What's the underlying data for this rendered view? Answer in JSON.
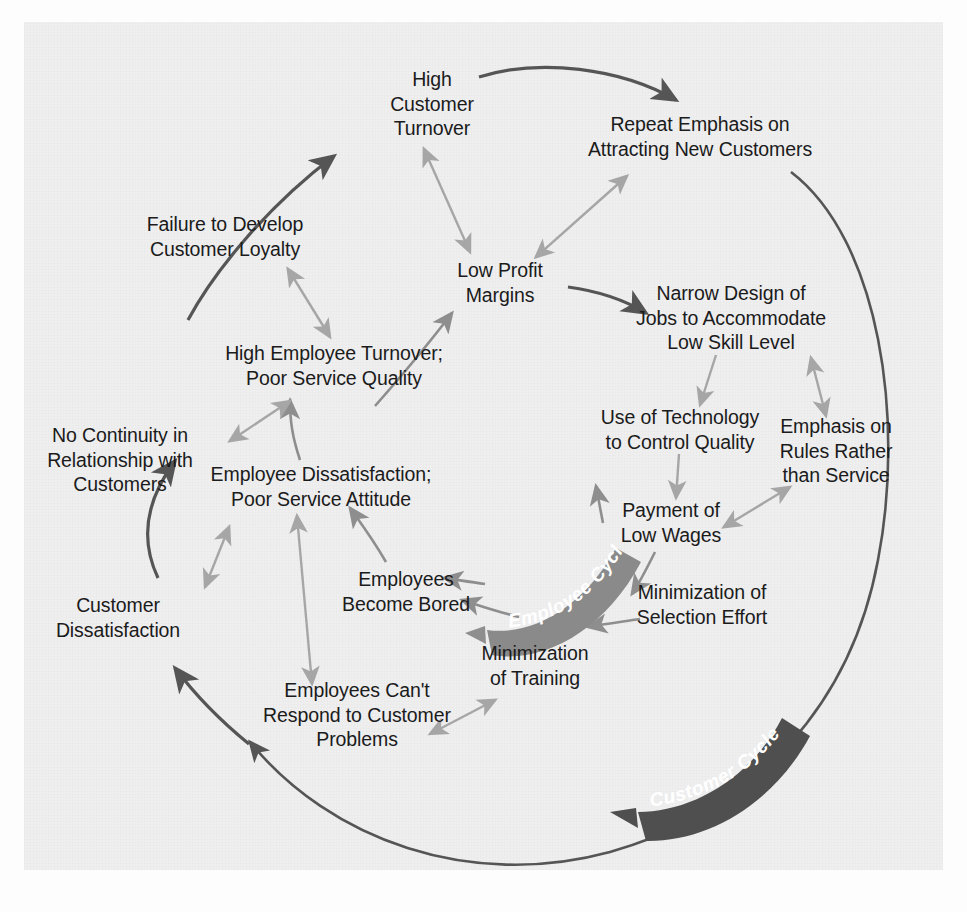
{
  "diagram": {
    "type": "cycle-diagram",
    "background_color": "#efeff0",
    "colors": {
      "dark_arrow": "#555555",
      "light_arrow": "#a6a6a6",
      "mid_arrow": "#8e8e8e",
      "employee_banner": "#8a8a8a",
      "customer_banner": "#4f4f4f",
      "text": "#1b1b1b",
      "banner_text": "#ffffff"
    },
    "nodes": [
      {
        "id": "high-customer-turnover",
        "label": "High\nCustomer\nTurnover",
        "x": 432,
        "y": 104
      },
      {
        "id": "repeat-emphasis",
        "label": "Repeat Emphasis on\nAttracting New Customers",
        "x": 700,
        "y": 137
      },
      {
        "id": "failure-develop-loyalty",
        "label": "Failure to Develop\nCustomer Loyalty",
        "x": 225,
        "y": 237
      },
      {
        "id": "low-profit-margins",
        "label": "Low Profit\nMargins",
        "x": 500,
        "y": 283
      },
      {
        "id": "narrow-design-jobs",
        "label": "Narrow Design of\nJobs to Accommodate\nLow Skill Level",
        "x": 731,
        "y": 318
      },
      {
        "id": "high-employee-turnover",
        "label": "High Employee Turnover;\nPoor Service Quality",
        "x": 334,
        "y": 366
      },
      {
        "id": "use-of-technology",
        "label": "Use of Technology\nto Control Quality",
        "x": 680,
        "y": 430
      },
      {
        "id": "emphasis-on-rules",
        "label": "Emphasis on\nRules Rather\nthan Service",
        "x": 836,
        "y": 451
      },
      {
        "id": "no-continuity",
        "label": "No Continuity in\nRelationship with\nCustomers",
        "x": 120,
        "y": 460
      },
      {
        "id": "employee-dissatisfaction",
        "label": "Employee Dissatisfaction;\nPoor Service Attitude",
        "x": 321,
        "y": 487
      },
      {
        "id": "payment-low-wages",
        "label": "Payment of\nLow Wages",
        "x": 671,
        "y": 523
      },
      {
        "id": "minimization-selection",
        "label": "Minimization of\nSelection Effort",
        "x": 702,
        "y": 605
      },
      {
        "id": "employees-become-bored",
        "label": "Employees\nBecome Bored",
        "x": 406,
        "y": 592
      },
      {
        "id": "customer-dissatisfaction",
        "label": "Customer\nDissatisfaction",
        "x": 118,
        "y": 618
      },
      {
        "id": "minimization-training",
        "label": "Minimization\nof Training",
        "x": 535,
        "y": 666
      },
      {
        "id": "employees-cant-respond",
        "label": "Employees Can't\nRespond to Customer\nProblems",
        "x": 357,
        "y": 715
      }
    ],
    "banners": [
      {
        "id": "employee-cycle",
        "label": "Employee Cycle",
        "color": "#8a8a8a"
      },
      {
        "id": "customer-cycle",
        "label": "Customer Cycle",
        "color": "#4f4f4f"
      }
    ],
    "edges": [
      {
        "from": "high-customer-turnover",
        "to": "repeat-emphasis",
        "style": "dark-curve",
        "heads": 1
      },
      {
        "from": "failure-develop-loyalty",
        "to": "high-customer-turnover",
        "style": "dark-curve",
        "heads": 1
      },
      {
        "from": "high-customer-turnover",
        "to": "low-profit-margins",
        "style": "light",
        "heads": 2
      },
      {
        "from": "low-profit-margins",
        "to": "repeat-emphasis",
        "style": "light",
        "heads": 2
      },
      {
        "from": "low-profit-margins",
        "to": "narrow-design-jobs",
        "style": "dark-curve",
        "heads": 1
      },
      {
        "from": "high-employee-turnover",
        "to": "failure-develop-loyalty",
        "style": "light",
        "heads": 2
      },
      {
        "from": "high-employee-turnover",
        "to": "low-profit-margins",
        "style": "mid-curve",
        "heads": 1
      },
      {
        "from": "narrow-design-jobs",
        "to": "use-of-technology",
        "style": "light",
        "heads": 1
      },
      {
        "from": "narrow-design-jobs",
        "to": "emphasis-on-rules",
        "style": "light",
        "heads": 2
      },
      {
        "from": "use-of-technology",
        "to": "payment-low-wages",
        "style": "light",
        "heads": 1
      },
      {
        "from": "payment-low-wages",
        "to": "emphasis-on-rules",
        "style": "light",
        "heads": 2
      },
      {
        "from": "payment-low-wages",
        "to": "minimization-selection",
        "style": "mid",
        "heads": 1
      },
      {
        "from": "no-continuity",
        "to": "high-employee-turnover",
        "style": "light",
        "heads": 2
      },
      {
        "from": "customer-dissatisfaction",
        "to": "no-continuity",
        "style": "dark-curve",
        "heads": 1
      },
      {
        "from": "employee-dissatisfaction",
        "to": "high-employee-turnover",
        "style": "mid",
        "heads": 1
      },
      {
        "from": "employee-dissatisfaction",
        "to": "customer-dissatisfaction",
        "style": "light",
        "heads": 2
      },
      {
        "from": "employees-become-bored",
        "to": "employee-dissatisfaction",
        "style": "mid",
        "heads": 1
      },
      {
        "from": "employees-cant-respond",
        "to": "employee-dissatisfaction",
        "style": "light",
        "heads": 2
      },
      {
        "from": "minimization-training",
        "to": "employees-become-bored",
        "style": "mid",
        "heads": 1
      },
      {
        "from": "minimization-selection",
        "to": "employees-become-bored",
        "style": "mid",
        "heads": 1
      },
      {
        "from": "minimization-training",
        "to": "employees-cant-respond",
        "style": "light",
        "heads": 2
      },
      {
        "from": "employees-cant-respond",
        "to": "customer-dissatisfaction",
        "style": "dark-curve",
        "heads": 1
      },
      {
        "from": "repeat-emphasis",
        "to": "outer-arc",
        "style": "dark-arc",
        "heads": 0
      }
    ]
  }
}
